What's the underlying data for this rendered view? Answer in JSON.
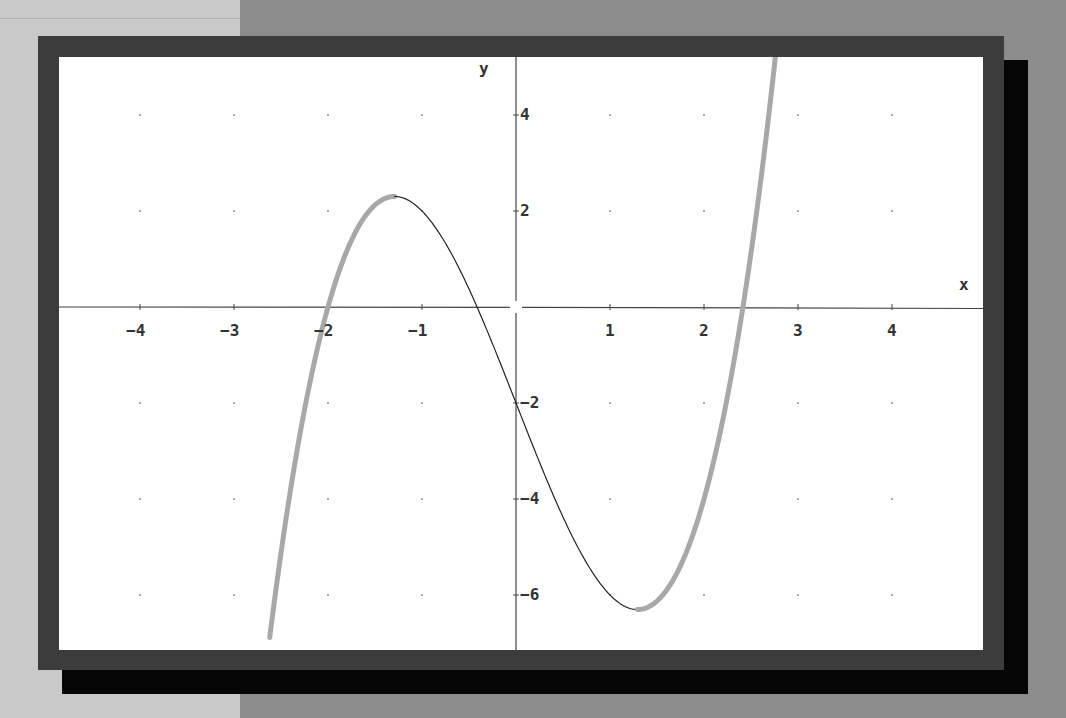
{
  "chart_data": {
    "type": "line",
    "title": "",
    "function": "y = x^3 - 5x - 2",
    "xlabel": "x",
    "ylabel": "y",
    "xlim": [
      -4.86,
      4.97
    ],
    "ylim": [
      -7.15,
      5.2
    ],
    "x_ticks": [
      -4,
      -3,
      -2,
      -1,
      1,
      2,
      3,
      4
    ],
    "x_tick_labels": [
      "-4",
      "-3",
      "-2",
      "-1",
      "1",
      "2",
      "3",
      "4"
    ],
    "y_ticks": [
      4,
      2,
      -2,
      -4,
      -6
    ],
    "y_tick_labels": [
      "4",
      "2",
      "-2",
      "-4",
      "-6"
    ],
    "grid": "dots at integer x and even y",
    "key_points": {
      "y_intercept": [
        0,
        -2
      ],
      "roots": [
        -2,
        -0.414,
        2.414
      ],
      "local_max": [
        -1.29,
        2.3
      ],
      "local_min": [
        1.29,
        -6.3
      ]
    },
    "series": [
      {
        "name": "increasing segment (thick gray)",
        "x_range": [
          -2.62,
          -1.29
        ],
        "color": "#a8a8a8",
        "width": 5
      },
      {
        "name": "decreasing segment (thin black)",
        "x_range": [
          -1.29,
          1.29
        ],
        "color": "#222222",
        "width": 1.2
      },
      {
        "name": "increasing segment (thick gray)",
        "x_range": [
          1.29,
          2.78
        ],
        "color": "#a8a8a8",
        "width": 5
      }
    ],
    "sample_points": [
      {
        "x": -2.6,
        "y": -6.58
      },
      {
        "x": -2.0,
        "y": 0.0
      },
      {
        "x": -1.29,
        "y": 2.3
      },
      {
        "x": -1.0,
        "y": 2.0
      },
      {
        "x": 0.0,
        "y": -2.0
      },
      {
        "x": 1.0,
        "y": -6.0
      },
      {
        "x": 1.29,
        "y": -6.3
      },
      {
        "x": 2.0,
        "y": -4.0
      },
      {
        "x": 2.414,
        "y": 0.0
      },
      {
        "x": 2.77,
        "y": 5.4
      }
    ]
  },
  "axes": {
    "x_label": "x",
    "y_label": "y"
  },
  "colors": {
    "frame": "#3c3c3c",
    "shadow": "#050505",
    "plot_bg": "#ffffff",
    "axis": "#444444",
    "curve_thick": "#a8a8a8",
    "curve_thin": "#222222"
  }
}
